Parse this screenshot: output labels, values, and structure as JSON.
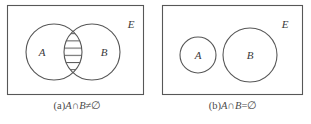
{
  "figure": {
    "stroke_color": "#575757",
    "text_color": "#3a3a3a",
    "background_color": "#ffffff",
    "hatch_color": "#575757"
  },
  "panels": [
    {
      "id": "a",
      "universe_label": "E",
      "circles": [
        {
          "label": "A",
          "cx": 54,
          "cy": 52,
          "r": 28
        },
        {
          "label": "B",
          "cx": 92,
          "cy": 52,
          "r": 28
        }
      ],
      "intersection_shaded": true,
      "shading_style": "horizontal-hatch",
      "hatch_line_count": 7,
      "caption": {
        "tag": "(a)",
        "left": "A",
        "operator": "∩",
        "right": "B",
        "relation": "≠",
        "result": "∅",
        "full": "(a)A∩B≠∅"
      }
    },
    {
      "id": "b",
      "universe_label": "E",
      "circles": [
        {
          "label": "A",
          "cx": 43,
          "cy": 55,
          "r": 18
        },
        {
          "label": "B",
          "cx": 95,
          "cy": 55,
          "r": 27
        }
      ],
      "intersection_shaded": false,
      "shading_style": "none",
      "hatch_line_count": 0,
      "caption": {
        "tag": "(b)",
        "left": "A",
        "operator": "∩",
        "right": "B",
        "relation": "=",
        "result": "∅",
        "full": "(b)A∩B=∅"
      }
    }
  ]
}
